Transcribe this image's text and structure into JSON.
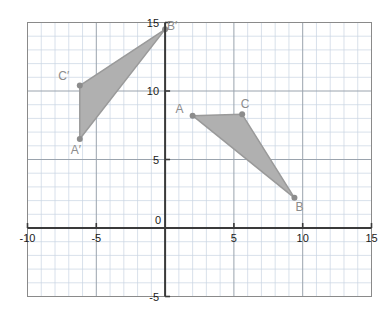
{
  "chart_data": {
    "type": "scatter",
    "title": "",
    "xlabel": "",
    "ylabel": "",
    "xlim": [
      -10,
      15
    ],
    "ylim": [
      -5,
      15
    ],
    "grid": true,
    "minor_grid_step": 1,
    "major_grid_step": 5,
    "legend": "none",
    "x_ticks": [
      -10,
      -5,
      0,
      5,
      10,
      15
    ],
    "y_ticks": [
      15,
      10,
      5,
      0,
      -5
    ],
    "x_tick_labels": [
      "-10",
      "-5",
      "0",
      "5",
      "10",
      "15"
    ],
    "y_tick_labels": [
      "15",
      "10",
      "5",
      "0",
      "-5"
    ],
    "origin_label": "0",
    "series": [
      {
        "name": "Triangle ABC",
        "type": "polygon",
        "fill": "#b0b0b0",
        "stroke": "#9a9a9a",
        "points": [
          {
            "label": "A",
            "x": 2,
            "y": 8.2,
            "label_dx": -13,
            "label_dy": -3
          },
          {
            "label": "B",
            "x": 9.4,
            "y": 2.2,
            "label_dx": 5,
            "label_dy": 13
          },
          {
            "label": "C",
            "x": 5.6,
            "y": 8.3,
            "label_dx": 3,
            "label_dy": -6
          }
        ]
      },
      {
        "name": "Triangle A'B'C'",
        "type": "polygon",
        "fill": "#b0b0b0",
        "stroke": "#9a9a9a",
        "points": [
          {
            "label": "A′",
            "x": -6.2,
            "y": 6.5,
            "label_dx": -4,
            "label_dy": 15
          },
          {
            "label": "B′",
            "x": 0.0,
            "y": 14.5,
            "label_dx": 7,
            "label_dy": 1
          },
          {
            "label": "C′",
            "x": -6.2,
            "y": 10.4,
            "label_dx": -16,
            "label_dy": -6
          }
        ]
      }
    ],
    "colors": {
      "minor_grid": "#c9d4e3",
      "major_grid": "#9aa3ad",
      "axis": "#3a3a3a",
      "plot_border": "#8a8a8a",
      "shape_fill": "#b0b0b0",
      "shape_stroke": "#9a9a9a",
      "vertex_dot": "#8c8c8c",
      "label_text": "#8c8c8c",
      "tick_text": "#1a1a1a",
      "background": "#ffffff"
    }
  }
}
